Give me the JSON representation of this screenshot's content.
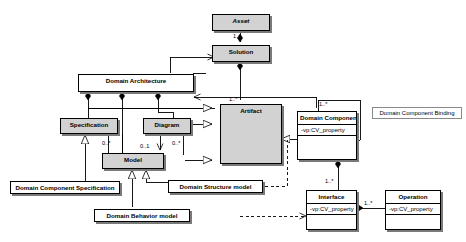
{
  "diagram": {
    "background": "#ffffff",
    "line_color": "#000000",
    "shaded_fill": "#d2d2d2",
    "plain_fill": "#ffffff",
    "width": 466,
    "height": 242
  },
  "classes": {
    "asset": {
      "name": "Asset",
      "abstract": true,
      "shaded": true,
      "attributes": []
    },
    "solution": {
      "name": "Solution",
      "abstract": false,
      "shaded": true,
      "attributes": []
    },
    "domain_architecture": {
      "name": "Domain Architecture",
      "abstract": false,
      "shaded": false,
      "attributes": []
    },
    "artifact": {
      "name": "Artifact",
      "abstract": false,
      "shaded": true,
      "attributes": []
    },
    "specification": {
      "name": "Specification",
      "abstract": false,
      "shaded": true,
      "attributes": []
    },
    "diagram_class": {
      "name": "Diagram",
      "abstract": false,
      "shaded": true,
      "attributes": []
    },
    "model": {
      "name": "Model",
      "abstract": false,
      "shaded": true,
      "attributes": []
    },
    "domain_component": {
      "name": "Domain Component",
      "abstract": false,
      "shaded": false,
      "attributes": [
        "-vp:CV_property"
      ]
    },
    "interface": {
      "name": "Interface",
      "abstract": false,
      "shaded": false,
      "attributes": [
        "-vp:CV_property"
      ]
    },
    "operation": {
      "name": "Operation",
      "abstract": false,
      "shaded": false,
      "attributes": [
        "-vp:CV_property"
      ]
    },
    "domain_component_specification": {
      "name": "Domain Component Specification",
      "abstract": false,
      "shaded": false,
      "attributes": []
    },
    "domain_structure_model": {
      "name": "Domain Structure model",
      "abstract": false,
      "shaded": false,
      "attributes": []
    },
    "domain_behavior_model": {
      "name": "Domain Behavior model",
      "abstract": false,
      "shaded": false,
      "attributes": []
    }
  },
  "notes": {
    "domain_component_binding": {
      "label": "Domain Component Binding"
    }
  },
  "multiplicities": {
    "asset_solution": "1",
    "solution_artifact": "1..*",
    "specification_model": "0..*",
    "model_diagram_left": "0..1",
    "diagram_model": "0..*",
    "domain_component_top": "1..*",
    "interface_to_component": "1..*",
    "operation_to_interface": "1..*"
  }
}
